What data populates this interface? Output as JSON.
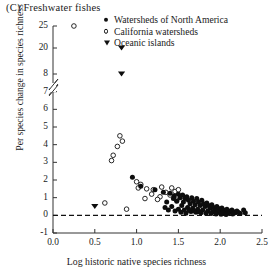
{
  "panel": {
    "label": "(C)  Freshwater fishes"
  },
  "legend": {
    "items": [
      {
        "marker": "filled-circle-icon",
        "label": "Watersheds of North America"
      },
      {
        "marker": "open-circle-icon",
        "label": "California watersheds"
      },
      {
        "marker": "filled-triangle-down-icon",
        "label": "Oceanic islands"
      }
    ]
  },
  "chart_data": {
    "type": "scatter",
    "title": "(C)  Freshwater fishes",
    "xlabel": "Log historic native species richness",
    "ylabel": "Per species change in species richness",
    "xlim": [
      0.0,
      2.5
    ],
    "xticks": [
      "0.0",
      "0.5",
      "1.0",
      "1.5",
      "2.0",
      "2.5"
    ],
    "xtick_values": [
      0.0,
      0.5,
      1.0,
      1.5,
      2.0,
      2.5
    ],
    "ylim": [
      -1,
      25
    ],
    "yticks": [
      "25",
      "20",
      "8",
      "7",
      "6",
      "5",
      "4",
      "3",
      "2",
      "1",
      "0",
      "-1"
    ],
    "ytick_values": [
      25,
      20,
      8,
      7,
      6,
      5,
      4,
      3,
      2,
      1,
      0,
      -1
    ],
    "axis_break": {
      "between": [
        20,
        8
      ],
      "note": "broken y-axis"
    },
    "grid": false,
    "legend_position": "top-right",
    "reference_line": {
      "y": 0,
      "style": "dashed"
    },
    "series": [
      {
        "name": "California watersheds",
        "marker": "open-circle",
        "points": [
          [
            0.25,
            25.0
          ],
          [
            0.8,
            4.5
          ],
          [
            0.83,
            4.2
          ],
          [
            0.77,
            3.9
          ],
          [
            0.72,
            3.4
          ],
          [
            0.7,
            3.1
          ],
          [
            0.62,
            0.7
          ],
          [
            0.88,
            0.35
          ],
          [
            1.0,
            1.9
          ],
          [
            1.05,
            1.75
          ],
          [
            1.02,
            1.55
          ],
          [
            1.12,
            1.5
          ],
          [
            1.2,
            1.45
          ],
          [
            1.18,
            1.2
          ],
          [
            1.3,
            1.6
          ],
          [
            1.35,
            1.3
          ],
          [
            1.28,
            1.05
          ],
          [
            1.42,
            1.55
          ],
          [
            1.46,
            1.35
          ],
          [
            1.4,
            1.15
          ],
          [
            1.5,
            1.45
          ],
          [
            1.55,
            1.1
          ],
          [
            1.48,
            0.85
          ],
          [
            1.25,
            0.9
          ],
          [
            1.1,
            0.95
          ]
        ]
      },
      {
        "name": "Watersheds of North America",
        "marker": "filled-circle",
        "points": [
          [
            0.95,
            2.15
          ],
          [
            1.05,
            1.65
          ],
          [
            1.22,
            1.45
          ],
          [
            1.32,
            1.3
          ],
          [
            1.4,
            1.25
          ],
          [
            1.45,
            1.1
          ],
          [
            1.44,
            0.95
          ],
          [
            1.5,
            1.2
          ],
          [
            1.52,
            1.0
          ],
          [
            1.48,
            0.8
          ],
          [
            1.55,
            1.15
          ],
          [
            1.58,
            0.95
          ],
          [
            1.56,
            0.75
          ],
          [
            1.54,
            0.55
          ],
          [
            1.6,
            1.05
          ],
          [
            1.62,
            0.85
          ],
          [
            1.64,
            0.65
          ],
          [
            1.61,
            0.45
          ],
          [
            1.66,
            1.0
          ],
          [
            1.68,
            0.8
          ],
          [
            1.7,
            0.6
          ],
          [
            1.67,
            0.4
          ],
          [
            1.65,
            0.22
          ],
          [
            1.72,
            0.95
          ],
          [
            1.74,
            0.75
          ],
          [
            1.76,
            0.55
          ],
          [
            1.73,
            0.35
          ],
          [
            1.71,
            0.18
          ],
          [
            1.78,
            0.85
          ],
          [
            1.8,
            0.65
          ],
          [
            1.82,
            0.5
          ],
          [
            1.79,
            0.3
          ],
          [
            1.77,
            0.15
          ],
          [
            1.84,
            0.7
          ],
          [
            1.86,
            0.55
          ],
          [
            1.88,
            0.4
          ],
          [
            1.85,
            0.25
          ],
          [
            1.83,
            0.12
          ],
          [
            1.9,
            0.6
          ],
          [
            1.92,
            0.45
          ],
          [
            1.94,
            0.32
          ],
          [
            1.91,
            0.2
          ],
          [
            1.89,
            0.1
          ],
          [
            1.96,
            0.5
          ],
          [
            1.98,
            0.38
          ],
          [
            2.0,
            0.28
          ],
          [
            1.97,
            0.16
          ],
          [
            1.95,
            0.08
          ],
          [
            2.02,
            0.42
          ],
          [
            2.04,
            0.3
          ],
          [
            2.06,
            0.22
          ],
          [
            2.03,
            0.14
          ],
          [
            2.01,
            0.06
          ],
          [
            2.08,
            0.35
          ],
          [
            2.1,
            0.25
          ],
          [
            2.12,
            0.18
          ],
          [
            2.09,
            0.1
          ],
          [
            2.07,
            0.05
          ],
          [
            2.14,
            0.3
          ],
          [
            2.16,
            0.2
          ],
          [
            2.18,
            0.14
          ],
          [
            2.15,
            0.08
          ],
          [
            2.2,
            0.25
          ],
          [
            2.22,
            0.16
          ],
          [
            2.24,
            0.1
          ],
          [
            2.28,
            0.3
          ],
          [
            2.3,
            0.15
          ],
          [
            1.42,
            0.5
          ],
          [
            1.38,
            0.3
          ],
          [
            1.46,
            0.25
          ],
          [
            1.36,
            0.75
          ],
          [
            1.34,
            0.45
          ],
          [
            1.5,
            0.35
          ],
          [
            1.53,
            0.18
          ],
          [
            1.57,
            0.3
          ],
          [
            1.59,
            0.12
          ],
          [
            1.63,
            0.28
          ],
          [
            1.69,
            0.25
          ],
          [
            1.75,
            0.2
          ]
        ]
      },
      {
        "name": "Oceanic islands",
        "marker": "filled-triangle-down",
        "points": [
          [
            0.82,
            20.0
          ],
          [
            0.82,
            8.0
          ],
          [
            0.5,
            0.5
          ]
        ]
      }
    ]
  },
  "axes": {
    "x": {
      "label": "Log historic native species richness"
    },
    "y": {
      "label": "Per species change in species richness"
    }
  }
}
